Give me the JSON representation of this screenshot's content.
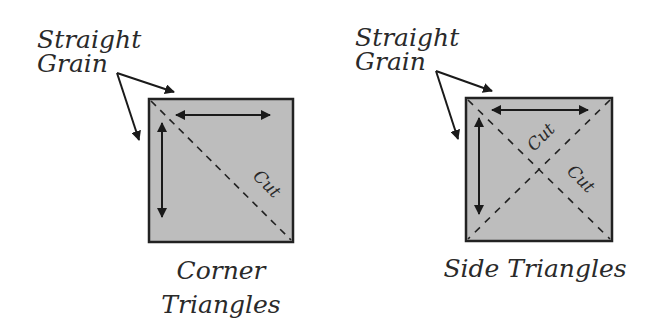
{
  "diagram": {
    "colors": {
      "fabric_fill": "#bdbdbd",
      "outline": "#222222",
      "text": "#2a2a2a",
      "background": "#ffffff"
    },
    "panels": [
      {
        "id": "corner",
        "pointer_label_line1": "Straight",
        "pointer_label_line2": "Grain",
        "cut_labels": [
          "Cut"
        ],
        "caption_line1": "Corner",
        "caption_line2": "Triangles",
        "cut_lines": "single diagonal, top-left to bottom-right"
      },
      {
        "id": "side",
        "pointer_label_line1": "Straight",
        "pointer_label_line2": "Grain",
        "cut_labels": [
          "Cut",
          "Cut"
        ],
        "caption_line1": "Side Triangles",
        "cut_lines": "both diagonals"
      }
    ]
  }
}
